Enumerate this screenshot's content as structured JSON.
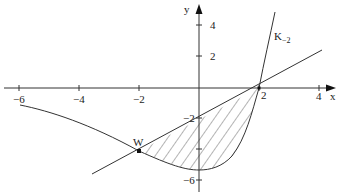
{
  "diagram": {
    "type": "function-plot",
    "axes": {
      "x_label": "x",
      "y_label": "y",
      "x_ticks": [
        {
          "value": -6,
          "label": "−6"
        },
        {
          "value": -4,
          "label": "−4"
        },
        {
          "value": -2,
          "label": "−2"
        },
        {
          "value": 2,
          "label": "2"
        },
        {
          "value": 4,
          "label": "4"
        }
      ],
      "y_ticks": [
        {
          "value": 4,
          "label": "4"
        },
        {
          "value": 2,
          "label": "2"
        },
        {
          "value": -2,
          "label": "−2"
        },
        {
          "value": -4,
          "label": ""
        },
        {
          "value": -6,
          "label": "−6"
        }
      ],
      "xlim": [
        -6.5,
        4.6
      ],
      "ylim": [
        -6.5,
        5.5
      ]
    },
    "curve": {
      "name": "K",
      "label_main": "K",
      "label_sub": "−2",
      "points": [
        [
          -6,
          -1.1
        ],
        [
          -4.6,
          -1.7
        ],
        [
          -3.3,
          -2.7
        ],
        [
          -2,
          -4
        ],
        [
          -1,
          -4.9
        ],
        [
          0,
          -5.3
        ],
        [
          0.9,
          -4.6
        ],
        [
          1.5,
          -3
        ],
        [
          2,
          0
        ],
        [
          2.3,
          2.4
        ],
        [
          2.5,
          4.9
        ]
      ]
    },
    "line": {
      "equation": "y = x - 2",
      "points": [
        [
          -3.6,
          -5.6
        ],
        [
          4.1,
          2.5
        ]
      ]
    },
    "point_w": {
      "label": "W",
      "x": -2,
      "y": -4
    },
    "intersection": {
      "x": 2,
      "y": 0
    },
    "shaded_region": "area between line y = x - 2 and curve K₂ for -2 ≤ x ≤ 2 (hatched)"
  }
}
